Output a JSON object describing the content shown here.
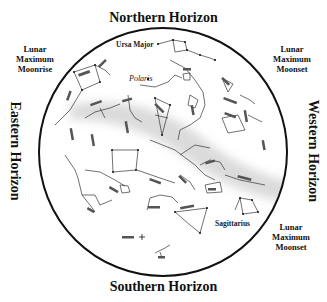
{
  "horizons": {
    "north": "Northern Horizon",
    "south": "Southern Horizon",
    "east": "Eastern Horizon",
    "west": "Western Horizon"
  },
  "lunar_notes": {
    "northeast_side": [
      "Lunar",
      "Maximum",
      "Moonrise"
    ],
    "northwest_side": [
      "Lunar",
      "Maximum",
      "Moonset"
    ],
    "southwest_side": [
      "Lunar",
      "Maximum",
      "Moonset"
    ]
  },
  "labels": {
    "ursa_major": "Ursa Major",
    "polaris": "Polaris",
    "sagittarius": "Sagittarius"
  },
  "colors": {
    "ink": "#111111",
    "milky_way": "#d9d9d9",
    "background": "#ffffff"
  }
}
